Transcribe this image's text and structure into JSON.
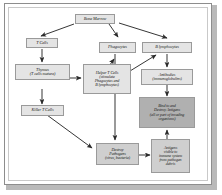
{
  "diagram": {
    "colors": {
      "page_background": "#ffffff",
      "node_light": "#e4e4e4",
      "node_mid": "#cfcfcf",
      "node_dark": "#b0b0b0",
      "node_border": "#9a9a9a",
      "arrow": "#2b2b2b",
      "frame_border": "#8d8d8d",
      "shadow": "#b9b9b9"
    },
    "nodes": [
      {
        "id": "bone-marrow",
        "label": "Bone Marrow"
      },
      {
        "id": "t-cells",
        "label": "T Cells"
      },
      {
        "id": "phagocytes",
        "label": "Phagocytes"
      },
      {
        "id": "b-lymphocytes",
        "label": "B lymphocytes"
      },
      {
        "id": "thymus",
        "line1": "Thymus",
        "line2": "(T cells mature)"
      },
      {
        "id": "helper-t-cells",
        "line1": "Helper T Cells",
        "line2": "(stimulate",
        "line3": "Phagocytes and",
        "line4": "B lymphocytes)"
      },
      {
        "id": "antibodies",
        "line1": "Antibodies",
        "line2": "(immunoglobulins)"
      },
      {
        "id": "killer-t-cells",
        "label": "Killer T Cells"
      },
      {
        "id": "bind-destroy",
        "line1": "Bind to and",
        "line2": "Destroy Antigens",
        "line3": "(all or part of invading",
        "line4": "organisms)"
      },
      {
        "id": "destroy-pathogens",
        "line1": "Destroy",
        "line2": "Pathogens",
        "line3": "(virus, bacteria)"
      },
      {
        "id": "antigens-visible",
        "line1": "Antigens",
        "line2": "visible to",
        "line3": "immune system",
        "line4": "from pathogen",
        "line5": "debris"
      }
    ],
    "edges": [
      {
        "from": "bone-marrow",
        "to": "t-cells"
      },
      {
        "from": "bone-marrow",
        "to": "phagocytes"
      },
      {
        "from": "bone-marrow",
        "to": "b-lymphocytes"
      },
      {
        "from": "t-cells",
        "to": "thymus"
      },
      {
        "from": "thymus",
        "to": "helper-t-cells"
      },
      {
        "from": "thymus",
        "to": "killer-t-cells"
      },
      {
        "from": "helper-t-cells",
        "to": "phagocytes"
      },
      {
        "from": "helper-t-cells",
        "to": "b-lymphocytes"
      },
      {
        "from": "b-lymphocytes",
        "to": "antibodies"
      },
      {
        "from": "antibodies",
        "to": "bind-destroy"
      },
      {
        "from": "phagocytes",
        "to": "destroy-pathogens"
      },
      {
        "from": "killer-t-cells",
        "to": "destroy-pathogens"
      },
      {
        "from": "destroy-pathogens",
        "to": "antigens-visible"
      },
      {
        "from": "antigens-visible",
        "to": "bind-destroy"
      }
    ]
  }
}
